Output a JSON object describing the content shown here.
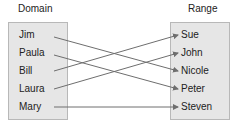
{
  "domain": {
    "title": "Domain",
    "items": [
      "Jim",
      "Paula",
      "Bill",
      "Laura",
      "Mary"
    ]
  },
  "range": {
    "title": "Range",
    "items": [
      "Sue",
      "John",
      "Nicole",
      "Peter",
      "Steven"
    ]
  },
  "mappings": [
    {
      "from": "Jim",
      "to": "Nicole"
    },
    {
      "from": "Paula",
      "to": "Peter"
    },
    {
      "from": "Bill",
      "to": "Sue"
    },
    {
      "from": "Laura",
      "to": "John"
    },
    {
      "from": "Mary",
      "to": "Steven"
    }
  ],
  "colors": {
    "arrow": "#6e6e6e",
    "box": "#e6e6e6"
  }
}
